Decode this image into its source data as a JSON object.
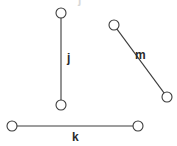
{
  "diagram": {
    "type": "line-segment-figure",
    "width": 177,
    "height": 146,
    "background_color": "#ffffff",
    "stroke_color": "#3c3c3c",
    "label_color": "#2b2b2b",
    "endpoint_fill": "#ffffff",
    "endpoint_radius": 5,
    "segments": [
      {
        "id": "j",
        "label": "j",
        "orientation": "vertical",
        "x1": 61,
        "y1": 13,
        "x2": 61,
        "y2": 105,
        "label_x": 67,
        "label_y": 52
      },
      {
        "id": "m",
        "label": "m",
        "orientation": "diagonal",
        "x1": 114,
        "y1": 25,
        "x2": 167,
        "y2": 97,
        "label_x": 135,
        "label_y": 49
      },
      {
        "id": "k",
        "label": "k",
        "orientation": "horizontal",
        "x1": 12,
        "y1": 126,
        "x2": 138,
        "y2": 126,
        "label_x": 72,
        "label_y": 131
      }
    ],
    "clipped_top_mark": {
      "text": "j",
      "x": 78,
      "y": -7,
      "color": "#d8d8d8"
    }
  }
}
